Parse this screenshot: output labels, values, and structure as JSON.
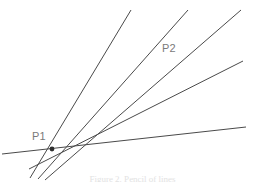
{
  "figure": {
    "background_color": "#ffffff",
    "stroke_color": "#4a4a4a",
    "label_color": "#7a7a7a",
    "caption_color": "#e2e2e2",
    "caption": "Figure 2. Pencil of lines",
    "labels": [
      {
        "id": "p1",
        "text": "P1",
        "x": 32,
        "y": 131
      },
      {
        "id": "p2",
        "text": "P2",
        "x": 162,
        "y": 43
      }
    ],
    "geometry": {
      "vanishing_point": {
        "x": 52,
        "y": 149
      },
      "line_count": 5,
      "lines": [
        {
          "id": "line-1",
          "x1": 30,
          "y1": 178,
          "x2": 131,
          "y2": 10,
          "stroke_width": 1.0
        },
        {
          "id": "line-2",
          "x1": 38,
          "y1": 179,
          "x2": 188,
          "y2": 10,
          "stroke_width": 1.0
        },
        {
          "id": "line-3",
          "x1": 45,
          "y1": 180,
          "x2": 241,
          "y2": 10,
          "stroke_width": 1.0
        },
        {
          "id": "line-4",
          "x1": 29,
          "y1": 169,
          "x2": 243,
          "y2": 61,
          "stroke_width": 1.0
        },
        {
          "id": "line-5",
          "x1": 2,
          "y1": 154,
          "x2": 246,
          "y2": 127,
          "stroke_width": 1.0
        }
      ]
    }
  }
}
